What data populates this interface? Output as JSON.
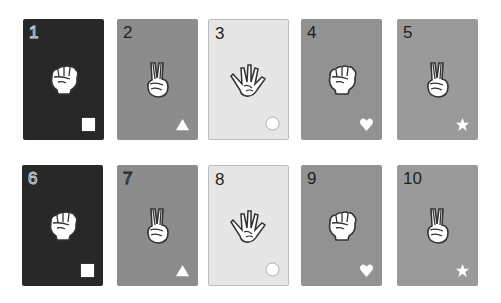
{
  "board": {
    "rows": [
      {
        "cards": [
          {
            "number": "1",
            "hand": "rock",
            "suit": "square",
            "color": "#282828"
          },
          {
            "number": "2",
            "hand": "scissors",
            "suit": "triangle",
            "color": "#8c8c8c"
          },
          {
            "number": "3",
            "hand": "paper",
            "suit": "circle",
            "color": "#e6e6e6"
          },
          {
            "number": "4",
            "hand": "rock",
            "suit": "heart",
            "color": "#929292"
          },
          {
            "number": "5",
            "hand": "scissors",
            "suit": "star",
            "color": "#9a9a9a"
          }
        ]
      },
      {
        "cards": [
          {
            "number": "6",
            "hand": "rock",
            "suit": "square",
            "color": "#282828"
          },
          {
            "number": "7",
            "hand": "scissors",
            "suit": "triangle",
            "color": "#8c8c8c"
          },
          {
            "number": "8",
            "hand": "paper",
            "suit": "circle",
            "color": "#e6e6e6"
          },
          {
            "number": "9",
            "hand": "rock",
            "suit": "heart",
            "color": "#929292"
          },
          {
            "number": "10",
            "hand": "scissors",
            "suit": "star",
            "color": "#9a9a9a"
          }
        ]
      }
    ]
  }
}
